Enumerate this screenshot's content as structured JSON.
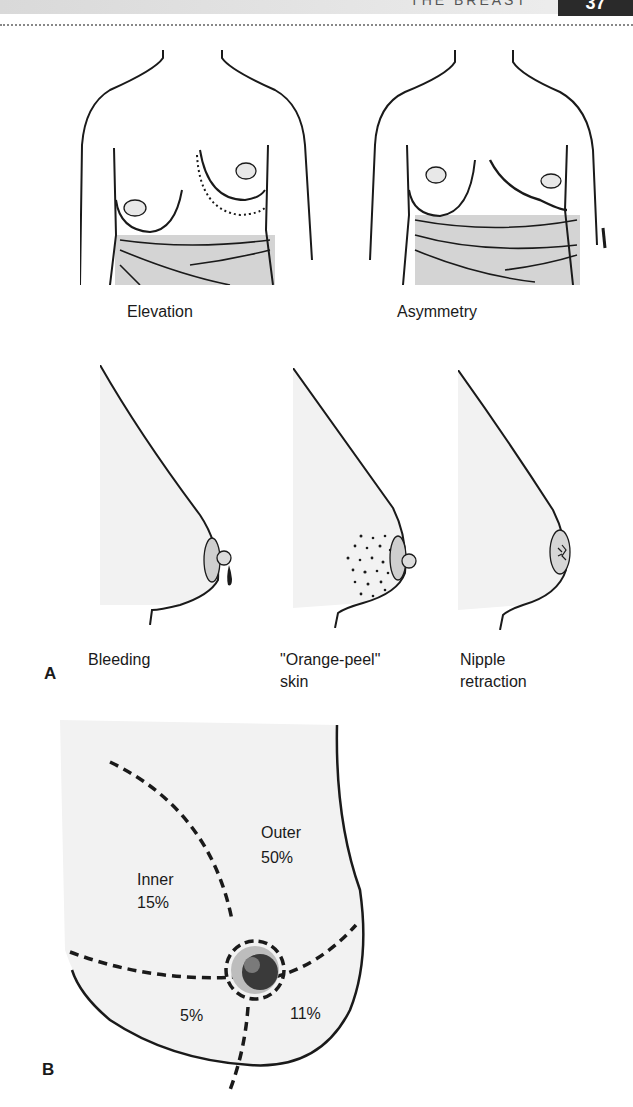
{
  "header": {
    "running_title": "THE BREAST",
    "page_number": "37"
  },
  "panel_a": {
    "letter": "A",
    "frontal_views": [
      {
        "label": "Elevation",
        "sign": "elevation"
      },
      {
        "label": "Asymmetry",
        "sign": "asymmetry"
      }
    ],
    "profile_views": [
      {
        "label_line1": "Bleeding",
        "label_line2": "",
        "sign": "bleeding"
      },
      {
        "label_line1": "\"Orange-peel\"",
        "label_line2": "skin",
        "sign": "orange-peel"
      },
      {
        "label_line1": "Nipple",
        "label_line2": "retraction",
        "sign": "nipple-retraction"
      }
    ]
  },
  "panel_b": {
    "letter": "B",
    "quadrants": [
      {
        "name": "Outer",
        "percent": "50%"
      },
      {
        "name": "Inner",
        "percent": "15%"
      },
      {
        "name": "",
        "percent": "5%"
      },
      {
        "name": "",
        "percent": "11%"
      }
    ]
  },
  "colors": {
    "ink": "#1a1a1a",
    "skin_shade": "#f2f2f2",
    "areola": "#cfcfcf",
    "wrap": "#d4d4d4",
    "header_tab": "#2a2a2a"
  }
}
